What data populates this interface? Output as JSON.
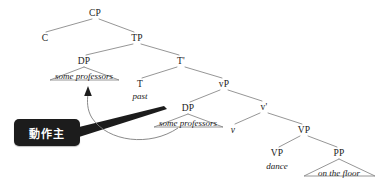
{
  "figure": {
    "type": "syntax-tree",
    "background_color": "#ffffff",
    "line_color": "#7a7a7a",
    "text_color": "#1a1a1a",
    "width": 389,
    "height": 185
  },
  "nodes": {
    "cp": {
      "label": "CP",
      "x": 95,
      "y": 13
    },
    "c": {
      "label": "C",
      "x": 45,
      "y": 38
    },
    "tp": {
      "label": "TP",
      "x": 137,
      "y": 38
    },
    "dp_upper": {
      "label": "DP",
      "x": 84,
      "y": 61
    },
    "tbar": {
      "label": "T'",
      "x": 181,
      "y": 61
    },
    "t": {
      "label": "T",
      "x": 140,
      "y": 84
    },
    "vp_small": {
      "label": "vP",
      "x": 224,
      "y": 84
    },
    "dp_lower": {
      "label": "DP",
      "x": 188,
      "y": 108
    },
    "vbar": {
      "label": "v'",
      "x": 264,
      "y": 107
    },
    "v_head": {
      "label": "v",
      "x": 233,
      "y": 130
    },
    "vp_big": {
      "label": "VP",
      "x": 304,
      "y": 130
    },
    "vp_inner": {
      "label": "VP",
      "x": 277,
      "y": 153
    },
    "pp": {
      "label": "PP",
      "x": 339,
      "y": 153
    }
  },
  "terminals": {
    "dp_upper_text": {
      "label": "some professors",
      "x": 84,
      "y": 76
    },
    "t_text": {
      "label": "past",
      "x": 140,
      "y": 96
    },
    "dp_lower_text": {
      "label": "some professors",
      "x": 188,
      "y": 123
    },
    "vp_inner_text": {
      "label": "dance",
      "x": 277,
      "y": 166
    },
    "pp_text": {
      "label": "on the floor",
      "x": 339,
      "y": 173
    }
  },
  "callout": {
    "label": "動作主",
    "x": 14,
    "y": 119,
    "width": 66,
    "height": 27,
    "background_color": "#1c1c1c",
    "text_color": "#ffffff"
  },
  "annotations": {
    "movement_arrow": "curved arrow from lower DP to upper DP",
    "pointer_wedge": "thick tapered wedge from callout to lower DP"
  }
}
